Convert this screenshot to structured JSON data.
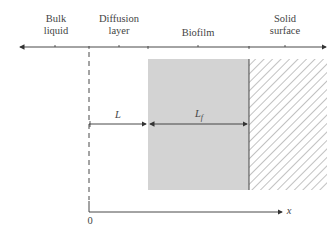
{
  "regions": [
    {
      "id": "bulk",
      "lines": [
        "Bulk",
        "liquid"
      ]
    },
    {
      "id": "diffusion",
      "lines": [
        "Diffusion",
        "layer"
      ]
    },
    {
      "id": "biofilm",
      "lines": [
        "Biofilm"
      ]
    },
    {
      "id": "solid",
      "lines": [
        "Solid",
        "surface"
      ]
    }
  ],
  "dimensions": {
    "L": "L",
    "Lf_main": "L",
    "Lf_sub": "f"
  },
  "axis": {
    "origin": "0",
    "variable": "x"
  },
  "colors": {
    "biofilm_fill": "#d3d3d3",
    "line": "#333333",
    "hatch": "#555555"
  }
}
